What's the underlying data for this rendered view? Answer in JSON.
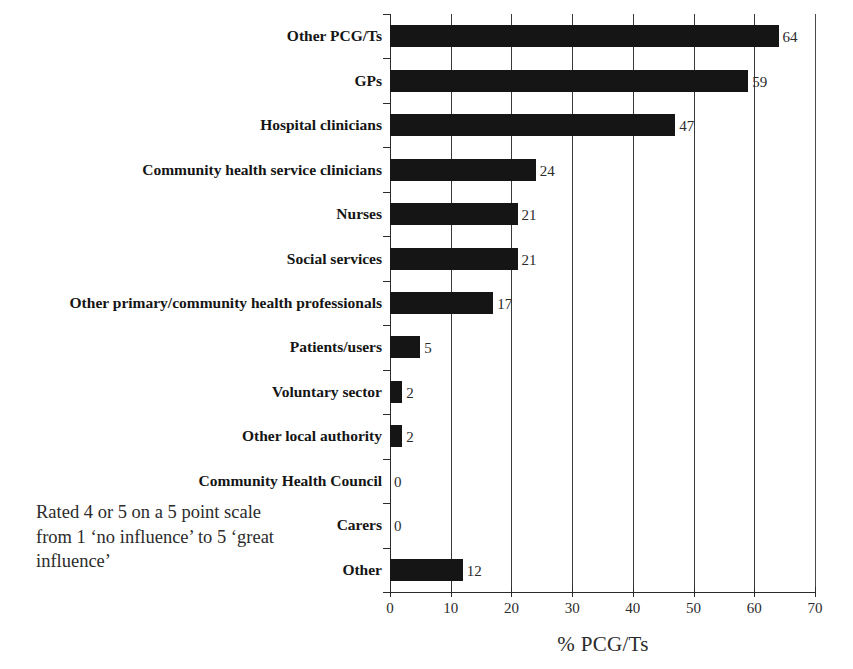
{
  "chart_data": {
    "type": "bar",
    "orientation": "horizontal",
    "title": "",
    "xlabel": "% PCG/Ts",
    "ylabel": "",
    "xlim": [
      0,
      70
    ],
    "xticks": [
      0,
      10,
      20,
      30,
      40,
      50,
      60,
      70
    ],
    "xtick_labels": [
      "0",
      "10",
      "20",
      "30",
      "40",
      "50",
      "60",
      "70"
    ],
    "grid": true,
    "grid_axis": "x",
    "legend": "none",
    "bar_color": "#151515",
    "categories": [
      "Other PCG/Ts",
      "GPs",
      "Hospital clinicians",
      "Community health service clinicians",
      "Nurses",
      "Social services",
      "Other primary/community health professionals",
      "Patients/users",
      "Voluntary sector",
      "Other local authority",
      "Community Health Council",
      "Carers",
      "Other"
    ],
    "values": [
      64,
      59,
      47,
      24,
      21,
      21,
      17,
      5,
      2,
      2,
      0,
      0,
      12
    ],
    "value_labels": [
      "64",
      "59",
      "47",
      "24",
      "21",
      "21",
      "17",
      "5",
      "2",
      "2",
      "0",
      "0",
      "12"
    ]
  },
  "annotation": {
    "line1": "Rated 4 or 5 on a 5 point scale",
    "line2": "from 1 ‘no influence’ to 5 ‘great",
    "line3": "influence’"
  }
}
